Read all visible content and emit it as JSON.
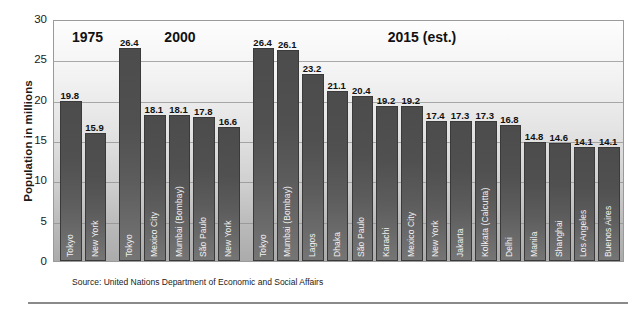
{
  "chart_data": {
    "type": "bar",
    "title": "",
    "xlabel": "",
    "ylabel": "Population in millions",
    "ylim": [
      0,
      30
    ],
    "yticks": [
      0,
      5,
      10,
      15,
      20,
      25,
      30
    ],
    "grid": true,
    "legend": "none",
    "group_labels": [
      "1975",
      "2000",
      "2015 (est.)"
    ],
    "groups": [
      {
        "label": "1975",
        "categories": [
          "Tokyo",
          "New York"
        ],
        "values": [
          19.8,
          15.9
        ]
      },
      {
        "label": "2000",
        "categories": [
          "Tokyo",
          "Mexico City",
          "Mumbai (Bombay)",
          "São Paulo",
          "New York"
        ],
        "values": [
          26.4,
          18.1,
          18.1,
          17.8,
          16.6
        ]
      },
      {
        "label": "2015 (est.)",
        "categories": [
          "Tokyo",
          "Mumbai (Bombay)",
          "Lagos",
          "Dhaka",
          "São Paulo",
          "Karachi",
          "Mexico City",
          "New York",
          "Jakarta",
          "Kolkata (Calcutta)",
          "Delhi",
          "Manila",
          "Shanghai",
          "Los Angeles",
          "Buenos Aires"
        ],
        "values": [
          26.4,
          26.1,
          23.2,
          21.1,
          20.4,
          19.2,
          19.2,
          17.4,
          17.3,
          17.3,
          16.8,
          14.8,
          14.6,
          14.1,
          14.1
        ]
      }
    ],
    "categories": [
      "Tokyo",
      "New York",
      "Tokyo",
      "Mexico City",
      "Mumbai (Bombay)",
      "São Paulo",
      "New York",
      "Tokyo",
      "Mumbai (Bombay)",
      "Lagos",
      "Dhaka",
      "São Paulo",
      "Karachi",
      "Mexico City",
      "New York",
      "Jakarta",
      "Kolkata (Calcutta)",
      "Delhi",
      "Manila",
      "Shanghai",
      "Los Angeles",
      "Buenos Aires"
    ],
    "values": [
      19.8,
      15.9,
      26.4,
      18.1,
      18.1,
      17.8,
      16.6,
      26.4,
      26.1,
      23.2,
      21.1,
      20.4,
      19.2,
      19.2,
      17.4,
      17.3,
      17.3,
      16.8,
      14.8,
      14.6,
      14.1,
      14.1
    ],
    "colors": {
      "bar": "#4f4f4f",
      "plot_background_top": "#fdfdfd",
      "plot_background_bottom": "#ababab",
      "gridline": "#8f8f8f",
      "text": "#111111"
    }
  },
  "source": {
    "note": "Source:  United Nations Department of Economic and Social Affairs"
  },
  "axis": {
    "y_title": "Population in millions",
    "y_tick_labels": [
      "30",
      "25",
      "20",
      "15",
      "10",
      "5",
      "0"
    ]
  }
}
